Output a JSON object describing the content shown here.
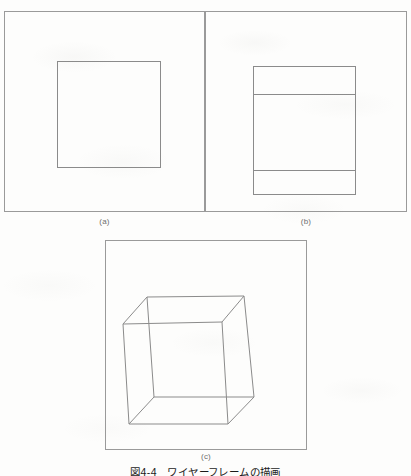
{
  "figure": {
    "caption": "図4-4　ワイヤーフレームの描画",
    "caption_number": "図4-4",
    "caption_title": "ワイヤーフレームの描画",
    "background_color": "#fdfdfc",
    "line_color": "#8b8b8b",
    "border_color": "#9a9a9a",
    "label_color": "#6e6e6e",
    "caption_color": "#1b1b1b"
  },
  "panels": [
    {
      "id": "a",
      "label": "(a)",
      "description": "front orthographic view of a cube rendered as a single square",
      "frame": {
        "x": 4,
        "y": 11,
        "width": 201,
        "height": 201
      },
      "shapes": [
        {
          "kind": "rect",
          "name": "cube-front-face-square",
          "x": 57,
          "y": 61,
          "width": 104,
          "height": 107
        }
      ]
    },
    {
      "id": "b",
      "label": "(b)",
      "description": "cube rotated slightly about the horizontal axis: outer rectangle with two interior horizontal edges",
      "frame": {
        "x": 205,
        "y": 11,
        "width": 202,
        "height": 201
      },
      "shapes": [
        {
          "kind": "rect",
          "name": "cube-outline-rect",
          "x": 253,
          "y": 66,
          "width": 103,
          "height": 129
        },
        {
          "kind": "line",
          "name": "cube-top-back-edge",
          "x1": 253,
          "y1": 94,
          "x2": 356,
          "y2": 94
        },
        {
          "kind": "line",
          "name": "cube-bottom-back-edge",
          "x1": 253,
          "y1": 170,
          "x2": 356,
          "y2": 170
        }
      ]
    },
    {
      "id": "c",
      "label": "(c)",
      "description": "full perspective wireframe cube with all twelve edges visible",
      "frame": {
        "x": 105,
        "y": 240,
        "width": 202,
        "height": 210
      },
      "vertices": {
        "back_top_left": {
          "x": 147,
          "y": 297
        },
        "back_top_right": {
          "x": 244,
          "y": 296
        },
        "back_bottom_left": {
          "x": 154,
          "y": 397
        },
        "back_bottom_right": {
          "x": 254,
          "y": 397
        },
        "front_top_left": {
          "x": 123,
          "y": 324
        },
        "front_top_right": {
          "x": 222,
          "y": 322
        },
        "front_bottom_left": {
          "x": 129,
          "y": 424
        },
        "front_bottom_right": {
          "x": 228,
          "y": 424
        }
      },
      "edges": [
        {
          "name": "back-top",
          "from": "back_top_left",
          "to": "back_top_right"
        },
        {
          "name": "back-right",
          "from": "back_top_right",
          "to": "back_bottom_right"
        },
        {
          "name": "back-bottom",
          "from": "back_bottom_right",
          "to": "back_bottom_left"
        },
        {
          "name": "back-left",
          "from": "back_bottom_left",
          "to": "back_top_left"
        },
        {
          "name": "front-top",
          "from": "front_top_left",
          "to": "front_top_right"
        },
        {
          "name": "front-right",
          "from": "front_top_right",
          "to": "front_bottom_right"
        },
        {
          "name": "front-bottom",
          "from": "front_bottom_right",
          "to": "front_bottom_left"
        },
        {
          "name": "front-left",
          "from": "front_bottom_left",
          "to": "front_top_left"
        },
        {
          "name": "connector-top-left",
          "from": "front_top_left",
          "to": "back_top_left"
        },
        {
          "name": "connector-top-right",
          "from": "front_top_right",
          "to": "back_top_right"
        },
        {
          "name": "connector-bottom-left",
          "from": "front_bottom_left",
          "to": "back_bottom_left"
        },
        {
          "name": "connector-bottom-right",
          "from": "front_bottom_right",
          "to": "back_bottom_right"
        }
      ]
    }
  ]
}
